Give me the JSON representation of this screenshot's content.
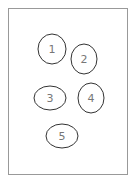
{
  "frame": {
    "x": 8,
    "y": 8,
    "w": 119,
    "h": 166,
    "stroke": "#999999"
  },
  "ellipses": [
    {
      "label": "1",
      "cx": 52,
      "cy": 49,
      "rx": 14,
      "ry": 15
    },
    {
      "label": "2",
      "cx": 84,
      "cy": 59,
      "rx": 13,
      "ry": 15
    },
    {
      "label": "3",
      "cx": 50,
      "cy": 98,
      "rx": 16,
      "ry": 12
    },
    {
      "label": "4",
      "cx": 91,
      "cy": 98,
      "rx": 13,
      "ry": 15
    },
    {
      "label": "5",
      "cx": 62,
      "cy": 136,
      "rx": 16,
      "ry": 12
    }
  ],
  "colors": {
    "ellipse_stroke": "#333333",
    "label": "#777777"
  }
}
